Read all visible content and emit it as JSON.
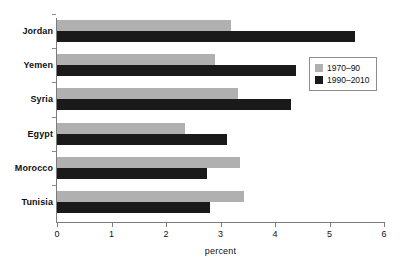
{
  "chart_data": {
    "type": "bar",
    "orientation": "horizontal",
    "title": "",
    "xlabel": "percent",
    "ylabel": "",
    "xlim": [
      0,
      6
    ],
    "xticks": [
      "0",
      "1",
      "2",
      "3",
      "4",
      "5",
      "6"
    ],
    "grid": false,
    "legend_position": "upper-right-inside",
    "categories": [
      "Jordan",
      "Yemen",
      "Syria",
      "Egypt",
      "Morocco",
      "Tunisia"
    ],
    "series": [
      {
        "name": "1970–90",
        "color": "#b0b0b0",
        "values": [
          3.19,
          2.9,
          3.32,
          2.35,
          3.36,
          3.43
        ]
      },
      {
        "name": "1990–2010",
        "color": "#1a1a1a",
        "values": [
          5.47,
          4.39,
          4.29,
          3.12,
          2.75,
          2.81
        ]
      }
    ]
  },
  "axis": {
    "x_title": "percent"
  },
  "colors": {
    "series_0": "#b0b0b0",
    "series_1": "#1a1a1a",
    "axis": "#7c7c7c",
    "text": "#111111",
    "background": "#ffffff"
  }
}
